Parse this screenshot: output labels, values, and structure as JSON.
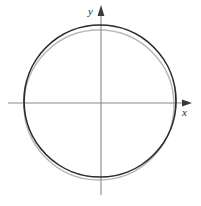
{
  "figure": {
    "background_color": "#ffffff",
    "width": 201,
    "height": 206
  },
  "axes": {
    "origin": {
      "x": 101,
      "y": 103
    },
    "color": "#8a8a8a",
    "stroke_width": 1.1,
    "x_axis": {
      "label": "x",
      "label_position": {
        "x": 182,
        "y": 107
      },
      "start": {
        "x": 8,
        "y": 103
      },
      "end": {
        "x": 190,
        "y": 103
      },
      "arrowhead": "right",
      "arrow_color": "#3a3a3a"
    },
    "y_axis": {
      "label": "y",
      "label_position": {
        "x": 88,
        "y": 6
      },
      "start": {
        "x": 101,
        "y": 195
      },
      "end": {
        "x": 101,
        "y": 8
      },
      "arrowhead": "up",
      "arrow_color": "#3a3a3a"
    }
  },
  "chart_data": {
    "type": "scatter",
    "xlabel": "x",
    "ylabel": "y",
    "grid": false,
    "legend": "none",
    "annotations": [],
    "series": [
      {
        "name": "circle-dark",
        "shape": "circle",
        "center_px": {
          "x": 100,
          "y": 101
        },
        "radius_px": 76,
        "color": "#2a2a2a",
        "stroke_width": 1.7,
        "x_intercepts_px": [
          24,
          176
        ],
        "y_intercepts_px": [
          25,
          177
        ]
      },
      {
        "name": "circle-gray",
        "shape": "circle",
        "center_px": {
          "x": 99,
          "y": 105
        },
        "radius_px": 75,
        "color": "#b8b8b8",
        "stroke_width": 1.5,
        "x_intercepts_px": [
          24,
          174
        ],
        "y_intercepts_px": [
          30,
          180
        ]
      }
    ]
  }
}
